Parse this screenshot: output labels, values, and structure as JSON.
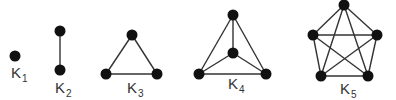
{
  "diagram": {
    "colors": {
      "node": "#111111",
      "edge": "#333333",
      "label": "#333333",
      "background": "#ffffff"
    },
    "graphs": [
      {
        "id": "K1",
        "label_base": "K",
        "label_sub": "1",
        "label_pos": [
          11,
          78
        ],
        "nodes": [
          [
            15,
            56
          ]
        ],
        "edges": []
      },
      {
        "id": "K2",
        "label_base": "K",
        "label_sub": "2",
        "label_pos": [
          55,
          93
        ],
        "nodes": [
          [
            60,
            31
          ],
          [
            60,
            70
          ]
        ],
        "edges": [
          [
            0,
            1
          ]
        ]
      },
      {
        "id": "K3",
        "label_base": "K",
        "label_sub": "3",
        "label_pos": [
          127,
          93
        ],
        "nodes": [
          [
            132,
            35
          ],
          [
            106,
            74
          ],
          [
            157,
            74
          ]
        ],
        "edges": [
          [
            0,
            1
          ],
          [
            0,
            2
          ],
          [
            1,
            2
          ]
        ]
      },
      {
        "id": "K4",
        "label_base": "K",
        "label_sub": "4",
        "label_pos": [
          228,
          89
        ],
        "nodes": [
          [
            233,
            15
          ],
          [
            233,
            53
          ],
          [
            199,
            74
          ],
          [
            266,
            74
          ]
        ],
        "edges": [
          [
            0,
            1
          ],
          [
            0,
            2
          ],
          [
            0,
            3
          ],
          [
            1,
            2
          ],
          [
            1,
            3
          ],
          [
            2,
            3
          ]
        ]
      },
      {
        "id": "K5",
        "label_base": "K",
        "label_sub": "5",
        "label_pos": [
          340,
          94
        ],
        "nodes": [
          [
            344,
            5
          ],
          [
            313,
            35
          ],
          [
            377,
            35
          ],
          [
            321,
            76
          ],
          [
            368,
            76
          ]
        ],
        "edges": [
          [
            0,
            1
          ],
          [
            0,
            2
          ],
          [
            0,
            3
          ],
          [
            0,
            4
          ],
          [
            1,
            2
          ],
          [
            1,
            3
          ],
          [
            1,
            4
          ],
          [
            2,
            3
          ],
          [
            2,
            4
          ],
          [
            3,
            4
          ]
        ]
      }
    ]
  }
}
